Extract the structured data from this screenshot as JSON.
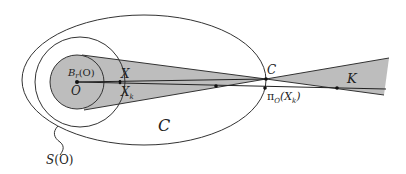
{
  "diagram": {
    "colors": {
      "stroke": "#333333",
      "fill_gray": "#bdbdbd",
      "background": "#ffffff"
    },
    "labels": {
      "ball": "B",
      "ball_sub": "r",
      "ball_arg": "(O)",
      "origin": "O",
      "x": "X",
      "xk": "X",
      "xk_sub": "k",
      "c_point": "C",
      "projection": "π",
      "projection_sub": "O",
      "projection_arg_open": "(X",
      "projection_arg_sub": "k",
      "projection_arg_close": ")",
      "cone": "K",
      "region": "C",
      "sphere": "S",
      "sphere_arg": "(O)"
    }
  }
}
